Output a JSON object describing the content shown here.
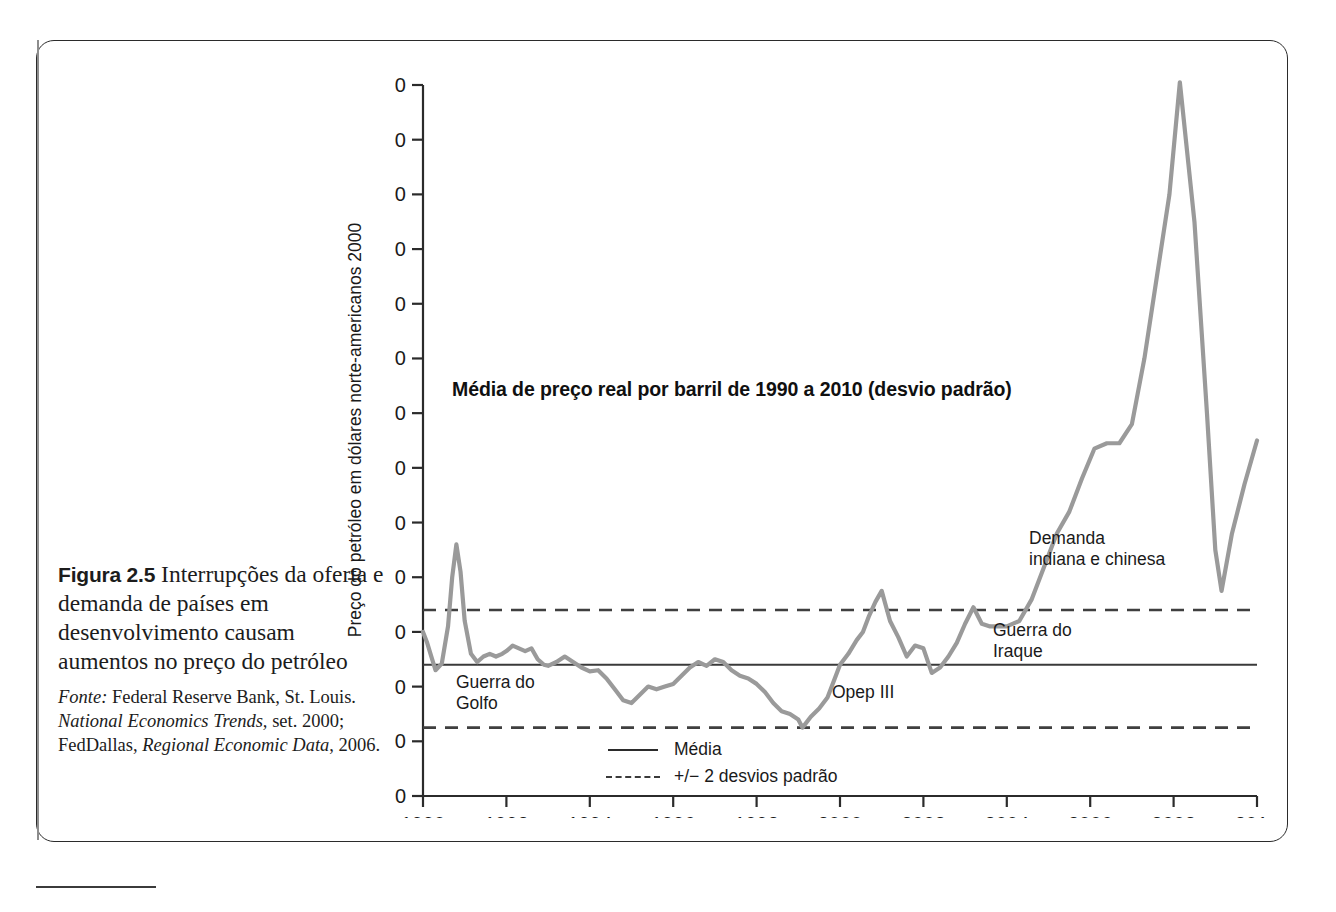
{
  "figure": {
    "number_label": "Figura 2.5",
    "caption": "Interrupções da oferta e demanda de países em desenvolvimento causam aumentos no preço do petróleo",
    "source_prefix": "Fonte:",
    "source_line1": "Federal Reserve Bank, St.",
    "source_line2_a": "Louis.",
    "source_line2_b": "National Economics Trends,",
    "source_line3_a": "set. 2000; FedDallas,",
    "source_line3_b": "Regional",
    "source_line4_a": "Economic Data",
    "source_line4_b": ", 2006."
  },
  "annotations": {
    "gulf_war_line1": "Guerra do",
    "gulf_war_line2": "Golfo",
    "opec3": "Opep III",
    "iraq_war_line1": "Guerra do",
    "iraq_war_line2": "Iraque",
    "demand_line1": "Demanda",
    "demand_line2": "indiana e chinesa"
  },
  "legend": {
    "mean_label": "Média",
    "band_label": "+/− 2 desvios padrão"
  },
  "colors": {
    "series": "#9a9a9a",
    "mean_line": "#3a3a3a",
    "band_line": "#3f3f3f",
    "axis": "#2b2b2b",
    "text": "#1a1a1a"
  },
  "chart_data": {
    "type": "line",
    "title": "Média de preço real por barril de 1990 a 2010 (desvio padrão)",
    "xlabel": "",
    "ylabel": "Preço do petróleo em dólares norte-americanos 2000",
    "xlim": [
      1990,
      2010
    ],
    "ylim": [
      0,
      130
    ],
    "yticks": [
      0,
      10,
      20,
      30,
      40,
      50,
      60,
      70,
      80,
      90,
      100,
      110,
      120,
      130
    ],
    "xticks": [
      1990,
      1992,
      1994,
      1996,
      1998,
      2000,
      2002,
      2004,
      2006,
      2008,
      2010
    ],
    "grid": false,
    "legend_position": "bottom-center",
    "reference_lines": [
      {
        "name": "+2 desvios padrão",
        "value": 34.0,
        "style": "dashed"
      },
      {
        "name": "Média",
        "value": 24.0,
        "style": "solid"
      },
      {
        "name": "-2 desvios padrão",
        "value": 12.5,
        "style": "dashed"
      }
    ],
    "series": [
      {
        "name": "Preço real do petróleo",
        "x": [
          1990.0,
          1990.1,
          1990.2,
          1990.3,
          1990.45,
          1990.6,
          1990.7,
          1990.8,
          1990.9,
          1991.0,
          1991.15,
          1991.3,
          1991.45,
          1991.6,
          1991.75,
          1991.9,
          1992.0,
          1992.15,
          1992.3,
          1992.45,
          1992.6,
          1992.75,
          1992.9,
          1993.0,
          1993.2,
          1993.4,
          1993.6,
          1993.8,
          1994.0,
          1994.2,
          1994.4,
          1994.6,
          1994.8,
          1995.0,
          1995.2,
          1995.4,
          1995.6,
          1995.8,
          1996.0,
          1996.2,
          1996.4,
          1996.6,
          1996.8,
          1997.0,
          1997.2,
          1997.4,
          1997.6,
          1997.8,
          1998.0,
          1998.2,
          1998.4,
          1998.6,
          1998.8,
          1999.0,
          1999.1,
          1999.3,
          1999.5,
          1999.7,
          1999.9,
          2000.0,
          2000.2,
          2000.4,
          2000.55,
          2000.7,
          2000.85,
          2001.0,
          2001.2,
          2001.4,
          2001.6,
          2001.8,
          2002.0,
          2002.2,
          2002.4,
          2002.6,
          2002.8,
          2003.0,
          2003.2,
          2003.4,
          2003.6,
          2003.8,
          2004.0,
          2004.3,
          2004.6,
          2004.9,
          2005.2,
          2005.5,
          2005.8,
          2006.1,
          2006.4,
          2006.7,
          2007.0,
          2007.3,
          2007.6,
          2007.9,
          2008.15,
          2008.5,
          2008.8,
          2009.0,
          2009.15,
          2009.4,
          2009.7,
          2010.0
        ],
        "y": [
          30.0,
          28.0,
          25.5,
          23.0,
          24.2,
          31.0,
          40.0,
          46.0,
          41.0,
          32.0,
          26.0,
          24.5,
          25.5,
          26.0,
          25.5,
          26.0,
          26.5,
          27.5,
          27.0,
          26.5,
          27.0,
          25.0,
          24.0,
          23.8,
          24.5,
          25.5,
          24.5,
          23.5,
          22.8,
          23.0,
          21.5,
          19.5,
          17.5,
          17.0,
          18.5,
          20.0,
          19.5,
          20.0,
          20.5,
          22.0,
          23.5,
          24.5,
          23.8,
          25.0,
          24.5,
          23.0,
          22.0,
          21.5,
          20.5,
          19.0,
          17.0,
          15.5,
          15.0,
          14.0,
          12.5,
          14.5,
          16.0,
          18.0,
          22.0,
          24.0,
          26.0,
          28.5,
          30.0,
          33.0,
          35.5,
          37.5,
          32.0,
          29.0,
          25.5,
          27.5,
          27.0,
          22.5,
          23.5,
          25.5,
          28.0,
          31.5,
          34.5,
          31.5,
          31.0,
          31.0,
          31.0,
          32.0,
          36.0,
          42.0,
          48.0,
          52.0,
          58.0,
          63.5,
          64.5,
          64.5,
          68.0,
          80.0,
          95.0,
          110.0,
          130.5,
          105.0,
          70.0,
          45.0,
          37.5,
          48.0,
          57.0,
          65.0
        ]
      }
    ]
  }
}
